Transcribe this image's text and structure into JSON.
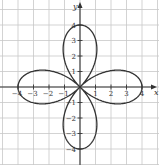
{
  "chart_data": {
    "type": "line",
    "title": "",
    "subtitle": "",
    "equation": "r = 4cos(2θ)",
    "xlabel": "x",
    "ylabel": "y",
    "xlim": [
      -5,
      5
    ],
    "ylim": [
      -5,
      5.5
    ],
    "grid": true,
    "legend": null,
    "x_ticks": [
      -4,
      -3,
      -2,
      -1,
      1,
      2,
      3,
      4
    ],
    "y_ticks": [
      -4,
      -3,
      -2,
      -1,
      1,
      2,
      3,
      4
    ],
    "x_tick_labels": [
      "-4",
      "-3",
      "-2",
      "-1",
      "1",
      "2",
      "3",
      "4"
    ],
    "y_tick_labels": [
      "-4",
      "-3",
      "-2",
      "-1",
      "1",
      "2",
      "3",
      "4"
    ],
    "series": [
      {
        "name": "rose curve",
        "petals": [
          {
            "direction": "right",
            "tip": [
              4,
              0
            ]
          },
          {
            "direction": "up",
            "tip": [
              0,
              4
            ]
          },
          {
            "direction": "left",
            "tip": [
              -4,
              0
            ]
          },
          {
            "direction": "down",
            "tip": [
              0,
              -4
            ]
          }
        ],
        "amplitude": 4,
        "n": 2
      }
    ]
  },
  "colors": {
    "grid": "#c8c8c8",
    "axis": "#333333",
    "curve": "#333333"
  },
  "layout": {
    "origin_px": [
      80,
      87
    ],
    "unit_px": 15.5
  }
}
